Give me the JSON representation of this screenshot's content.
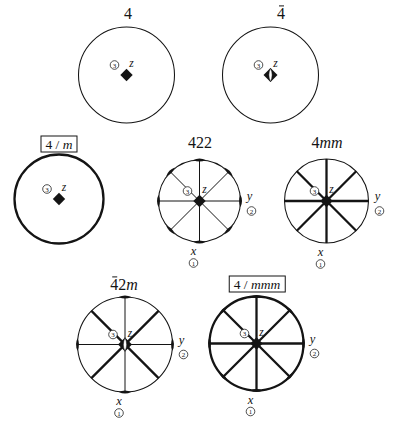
{
  "canvas": {
    "width": 397,
    "height": 422,
    "background": "#ffffff",
    "ink": "#141414"
  },
  "axis_text": {
    "x_letter": "x",
    "x_number": "1",
    "y_letter": "y",
    "y_number": "2",
    "z_letter": "z",
    "z_number": "3"
  },
  "diagrams": [
    {
      "id": "pg-4",
      "label_parts": [
        {
          "t": "4"
        }
      ],
      "boxed": false,
      "label_x": 128,
      "label_y": 14,
      "cx": 126.5,
      "cy": 75,
      "r": 48,
      "bold_circle": false,
      "diameters": [],
      "lenses": [],
      "center": "square",
      "axes": [
        "z"
      ]
    },
    {
      "id": "pg-4bar",
      "label_parts": [
        {
          "t": "4",
          "bar": true
        }
      ],
      "boxed": false,
      "label_x": 281,
      "label_y": 14,
      "cx": 270.5,
      "cy": 75,
      "r": 48,
      "bold_circle": false,
      "diameters": [],
      "lenses": [],
      "center": "fourbar",
      "axes": [
        "z"
      ]
    },
    {
      "id": "pg-4m",
      "label_parts": [
        {
          "t": "4"
        },
        {
          "t": " / "
        },
        {
          "t": "m",
          "i": true
        }
      ],
      "boxed": true,
      "label_x": 59,
      "label_y": 143.5,
      "cx": 59,
      "cy": 199,
      "r": 44.5,
      "bold_circle": true,
      "diameters": [],
      "lenses": [],
      "center": "square",
      "axes": [
        "z"
      ]
    },
    {
      "id": "pg-422",
      "label_parts": [
        {
          "t": "422"
        }
      ],
      "boxed": false,
      "label_x": 200,
      "label_y": 143,
      "cx": 199.5,
      "cy": 201,
      "r": 41,
      "bold_circle": false,
      "diameters": [
        {
          "a": 0
        },
        {
          "a": 45
        },
        {
          "a": 90
        },
        {
          "a": 135
        }
      ],
      "lenses": [
        0,
        45,
        90,
        135,
        180,
        225,
        270,
        315
      ],
      "center": "square",
      "axes": [
        "z",
        "y",
        "x"
      ]
    },
    {
      "id": "pg-4mm",
      "label_parts": [
        {
          "t": "4"
        },
        {
          "t": "mm",
          "i": true
        }
      ],
      "boxed": false,
      "label_x": 327,
      "label_y": 142.5,
      "cx": 326.5,
      "cy": 201,
      "r": 42,
      "bold_circle": false,
      "diameters": [
        {
          "a": 0,
          "bold": true
        },
        {
          "a": 45,
          "bold": true
        },
        {
          "a": 90,
          "bold": true
        },
        {
          "a": 135,
          "bold": true
        }
      ],
      "lenses": [],
      "center": "square",
      "axes": [
        "z",
        "y",
        "x"
      ]
    },
    {
      "id": "pg-42m",
      "label_parts": [
        {
          "t": "4",
          "bar": true
        },
        {
          "t": "2"
        },
        {
          "t": "m",
          "i": true
        }
      ],
      "boxed": false,
      "label_x": 124,
      "label_y": 285,
      "cx": 125,
      "cy": 344.5,
      "r": 47.5,
      "bold_circle": false,
      "diameters": [
        {
          "a": 0
        },
        {
          "a": 90
        },
        {
          "a": 45,
          "bold": true
        },
        {
          "a": 135,
          "bold": true
        }
      ],
      "lenses": [
        0,
        90,
        180,
        270
      ],
      "center": "fourbar",
      "axes": [
        "z",
        "y",
        "x"
      ]
    },
    {
      "id": "pg-4mmm",
      "label_parts": [
        {
          "t": "4"
        },
        {
          "t": " / "
        },
        {
          "t": "mmm",
          "i": true
        }
      ],
      "boxed": true,
      "label_x": 257,
      "label_y": 284,
      "cx": 256.5,
      "cy": 343.5,
      "r": 47,
      "bold_circle": true,
      "diameters": [
        {
          "a": 0,
          "bold": true
        },
        {
          "a": 45,
          "bold": true
        },
        {
          "a": 90,
          "bold": true
        },
        {
          "a": 135,
          "bold": true
        }
      ],
      "lenses": [
        0,
        45,
        90,
        135,
        180,
        225,
        270,
        315
      ],
      "center": "square",
      "axes": [
        "z",
        "y",
        "x"
      ]
    }
  ]
}
